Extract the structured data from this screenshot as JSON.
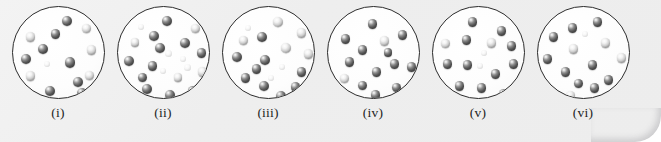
{
  "figure": {
    "type": "particle-diagram",
    "background_color": "#efefef",
    "circle_outline_color": "#2c2c2c",
    "circle_fill_color": "#ffffff",
    "sphere_color": "#4a4a4a",
    "sphere_highlight_color": "#ffffff",
    "panel_count": 6
  },
  "panels": [
    {
      "label": "(i)",
      "particle_count": 14,
      "particles": [
        {
          "x": 49,
          "y": 9,
          "r": 5.2,
          "shade": "dark"
        },
        {
          "x": 69,
          "y": 17,
          "r": 4.6,
          "shade": "pale"
        },
        {
          "x": 38,
          "y": 22,
          "r": 4.8,
          "shade": "dark"
        },
        {
          "x": 13,
          "y": 25,
          "r": 4.8,
          "shade": "pale"
        },
        {
          "x": 25,
          "y": 37,
          "r": 5.2,
          "shade": "dark"
        },
        {
          "x": 74,
          "y": 38,
          "r": 4.8,
          "shade": "pale"
        },
        {
          "x": 8,
          "y": 47,
          "r": 5.0,
          "shade": "dark"
        },
        {
          "x": 52,
          "y": 50,
          "r": 5.4,
          "shade": "dark"
        },
        {
          "x": 31,
          "y": 54,
          "r": 3.0,
          "shade": "faint"
        },
        {
          "x": 13,
          "y": 64,
          "r": 4.8,
          "shade": "pale"
        },
        {
          "x": 72,
          "y": 64,
          "r": 4.6,
          "shade": "pale"
        },
        {
          "x": 60,
          "y": 70,
          "r": 5.0,
          "shade": "dark"
        },
        {
          "x": 32,
          "y": 79,
          "r": 5.2,
          "shade": "dark"
        },
        {
          "x": 64,
          "y": 81,
          "r": 5.0,
          "shade": "dark"
        }
      ]
    },
    {
      "label": "(ii)",
      "particle_count": 20,
      "particles": [
        {
          "x": 44,
          "y": 9,
          "r": 5.2,
          "shade": "dark"
        },
        {
          "x": 73,
          "y": 17,
          "r": 4.6,
          "shade": "pale"
        },
        {
          "x": 20,
          "y": 17,
          "r": 3.2,
          "shade": "faint"
        },
        {
          "x": 31,
          "y": 24,
          "r": 5.0,
          "shade": "dark"
        },
        {
          "x": 62,
          "y": 31,
          "r": 5.0,
          "shade": "dark"
        },
        {
          "x": 13,
          "y": 31,
          "r": 4.4,
          "shade": "pale"
        },
        {
          "x": 37,
          "y": 36,
          "r": 5.0,
          "shade": "dark"
        },
        {
          "x": 79,
          "y": 41,
          "r": 4.8,
          "shade": "dark"
        },
        {
          "x": 47,
          "y": 43,
          "r": 3.6,
          "shade": "faint"
        },
        {
          "x": 6,
          "y": 49,
          "r": 5.0,
          "shade": "dark"
        },
        {
          "x": 30,
          "y": 54,
          "r": 4.8,
          "shade": "dark"
        },
        {
          "x": 66,
          "y": 57,
          "r": 3.6,
          "shade": "faint"
        },
        {
          "x": 80,
          "y": 60,
          "r": 4.8,
          "shade": "pale"
        },
        {
          "x": 42,
          "y": 61,
          "r": 3.0,
          "shade": "faint"
        },
        {
          "x": 20,
          "y": 66,
          "r": 4.6,
          "shade": "dark"
        },
        {
          "x": 56,
          "y": 66,
          "r": 4.4,
          "shade": "pale"
        },
        {
          "x": 24,
          "y": 77,
          "r": 5.0,
          "shade": "dark"
        },
        {
          "x": 70,
          "y": 79,
          "r": 4.8,
          "shade": "dark"
        },
        {
          "x": 47,
          "y": 83,
          "r": 5.0,
          "shade": "dark"
        },
        {
          "x": 62,
          "y": 49,
          "r": 3.0,
          "shade": "faint"
        }
      ]
    },
    {
      "label": "(iii)",
      "particle_count": 17,
      "particles": [
        {
          "x": 50,
          "y": 10,
          "r": 5.2,
          "shade": "pale"
        },
        {
          "x": 22,
          "y": 18,
          "r": 3.2,
          "shade": "faint"
        },
        {
          "x": 74,
          "y": 21,
          "r": 4.8,
          "shade": "pale"
        },
        {
          "x": 34,
          "y": 25,
          "r": 5.0,
          "shade": "dark"
        },
        {
          "x": 16,
          "y": 29,
          "r": 4.6,
          "shade": "pale"
        },
        {
          "x": 58,
          "y": 36,
          "r": 5.0,
          "shade": "pale"
        },
        {
          "x": 81,
          "y": 42,
          "r": 4.8,
          "shade": "pale"
        },
        {
          "x": 9,
          "y": 45,
          "r": 5.0,
          "shade": "dark"
        },
        {
          "x": 37,
          "y": 48,
          "r": 5.0,
          "shade": "dark"
        },
        {
          "x": 29,
          "y": 57,
          "r": 4.8,
          "shade": "dark"
        },
        {
          "x": 56,
          "y": 57,
          "r": 3.2,
          "shade": "faint"
        },
        {
          "x": 74,
          "y": 60,
          "r": 4.8,
          "shade": "dark"
        },
        {
          "x": 18,
          "y": 66,
          "r": 4.8,
          "shade": "dark"
        },
        {
          "x": 45,
          "y": 68,
          "r": 3.0,
          "shade": "faint"
        },
        {
          "x": 36,
          "y": 74,
          "r": 5.0,
          "shade": "dark"
        },
        {
          "x": 68,
          "y": 75,
          "r": 4.8,
          "shade": "dark"
        },
        {
          "x": 53,
          "y": 84,
          "r": 5.0,
          "shade": "dark"
        }
      ]
    },
    {
      "label": "(iv)",
      "particle_count": 14,
      "particles": [
        {
          "x": 40,
          "y": 12,
          "r": 4.8,
          "shade": "dark"
        },
        {
          "x": 70,
          "y": 23,
          "r": 4.8,
          "shade": "dark"
        },
        {
          "x": 13,
          "y": 27,
          "r": 4.8,
          "shade": "dark"
        },
        {
          "x": 52,
          "y": 29,
          "r": 4.8,
          "shade": "pale"
        },
        {
          "x": 30,
          "y": 38,
          "r": 4.8,
          "shade": "dark"
        },
        {
          "x": 17,
          "y": 50,
          "r": 4.8,
          "shade": "dark"
        },
        {
          "x": 62,
          "y": 52,
          "r": 4.8,
          "shade": "dark"
        },
        {
          "x": 79,
          "y": 55,
          "r": 4.8,
          "shade": "dark"
        },
        {
          "x": 44,
          "y": 60,
          "r": 4.8,
          "shade": "dark"
        },
        {
          "x": 12,
          "y": 67,
          "r": 4.6,
          "shade": "pale"
        },
        {
          "x": 30,
          "y": 74,
          "r": 4.6,
          "shade": "dark"
        },
        {
          "x": 64,
          "y": 76,
          "r": 4.6,
          "shade": "dark"
        },
        {
          "x": 43,
          "y": 83,
          "r": 4.8,
          "shade": "dark"
        },
        {
          "x": 56,
          "y": 41,
          "r": 4.4,
          "shade": "dark"
        }
      ]
    },
    {
      "label": "(v)",
      "particle_count": 15,
      "particles": [
        {
          "x": 35,
          "y": 10,
          "r": 4.8,
          "shade": "dark"
        },
        {
          "x": 64,
          "y": 19,
          "r": 4.8,
          "shade": "dark"
        },
        {
          "x": 29,
          "y": 28,
          "r": 4.8,
          "shade": "dark"
        },
        {
          "x": 54,
          "y": 31,
          "r": 4.8,
          "shade": "pale"
        },
        {
          "x": 8,
          "y": 32,
          "r": 4.6,
          "shade": "pale"
        },
        {
          "x": 74,
          "y": 34,
          "r": 4.8,
          "shade": "dark"
        },
        {
          "x": 10,
          "y": 52,
          "r": 4.8,
          "shade": "dark"
        },
        {
          "x": 30,
          "y": 53,
          "r": 4.8,
          "shade": "dark"
        },
        {
          "x": 76,
          "y": 52,
          "r": 4.8,
          "shade": "dark"
        },
        {
          "x": 44,
          "y": 56,
          "r": 3.0,
          "shade": "faint"
        },
        {
          "x": 58,
          "y": 62,
          "r": 4.8,
          "shade": "dark"
        },
        {
          "x": 22,
          "y": 74,
          "r": 4.8,
          "shade": "dark"
        },
        {
          "x": 44,
          "y": 76,
          "r": 4.8,
          "shade": "dark"
        },
        {
          "x": 66,
          "y": 82,
          "r": 4.8,
          "shade": "dark"
        },
        {
          "x": 48,
          "y": 43,
          "r": 3.0,
          "shade": "faint"
        }
      ]
    },
    {
      "label": "(vi)",
      "particle_count": 14,
      "particles": [
        {
          "x": 55,
          "y": 10,
          "r": 4.8,
          "shade": "dark"
        },
        {
          "x": 30,
          "y": 16,
          "r": 4.8,
          "shade": "dark"
        },
        {
          "x": 11,
          "y": 25,
          "r": 4.8,
          "shade": "dark"
        },
        {
          "x": 63,
          "y": 31,
          "r": 4.8,
          "shade": "pale"
        },
        {
          "x": 31,
          "y": 37,
          "r": 4.8,
          "shade": "pale"
        },
        {
          "x": 5,
          "y": 47,
          "r": 4.8,
          "shade": "dark"
        },
        {
          "x": 79,
          "y": 46,
          "r": 4.8,
          "shade": "pale"
        },
        {
          "x": 50,
          "y": 53,
          "r": 4.8,
          "shade": "dark"
        },
        {
          "x": 23,
          "y": 60,
          "r": 4.8,
          "shade": "dark"
        },
        {
          "x": 66,
          "y": 68,
          "r": 4.8,
          "shade": "dark"
        },
        {
          "x": 36,
          "y": 72,
          "r": 4.6,
          "shade": "dark"
        },
        {
          "x": 52,
          "y": 76,
          "r": 4.8,
          "shade": "dark"
        },
        {
          "x": 28,
          "y": 84,
          "r": 4.6,
          "shade": "pale"
        },
        {
          "x": 44,
          "y": 24,
          "r": 3.0,
          "shade": "faint"
        }
      ]
    }
  ]
}
